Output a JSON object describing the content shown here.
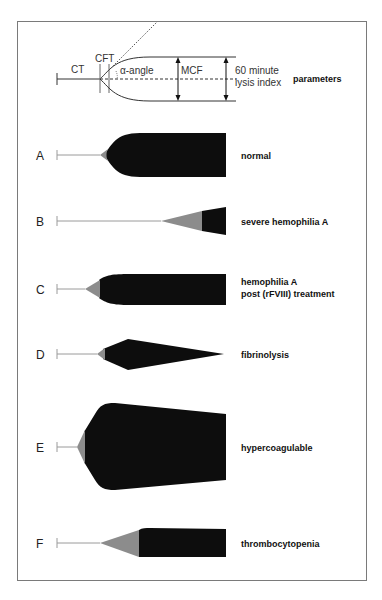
{
  "parameters_diagram": {
    "labels": {
      "ct": "CT",
      "cft": "CFT",
      "alpha_angle": "α-angle",
      "mcf": "MCF",
      "lysis_line1": "60 minute",
      "lysis_line2": "lysis index"
    },
    "title": "parameters"
  },
  "rows": [
    {
      "letter": "A",
      "description": [
        "normal"
      ]
    },
    {
      "letter": "B",
      "description": [
        "severe hemophilia A"
      ]
    },
    {
      "letter": "C",
      "description": [
        "hemophilia A",
        "post (rFVIII) treatment"
      ]
    },
    {
      "letter": "D",
      "description": [
        "fibrinolysis"
      ]
    },
    {
      "letter": "E",
      "description": [
        "hypercoagulable"
      ]
    },
    {
      "letter": "F",
      "description": [
        "thrombocytopenia"
      ]
    }
  ],
  "colors": {
    "clot_fill": "#0d0d0d",
    "cft_fill": "#8c8c8c",
    "baseline": "#9a9a9a",
    "frame": "#7a7a7a"
  }
}
